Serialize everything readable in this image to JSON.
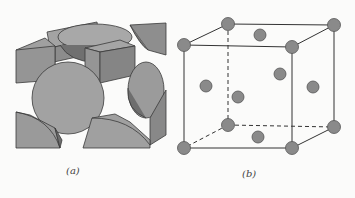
{
  "figure": {
    "panel_a": {
      "label": "(a)",
      "description": "hard-sphere model of face-centered cubic unit cell",
      "colors": {
        "sphere": "#9a9a9a",
        "sphere_dark": "#6f6f6f",
        "edge": "#3a3a3a"
      }
    },
    "panel_b": {
      "label": "(b)",
      "description": "reduced-sphere face-centered cubic unit cell",
      "colors": {
        "atom": "#8a8a8a",
        "atom_stroke": "#555555",
        "line": "#333333"
      }
    }
  }
}
